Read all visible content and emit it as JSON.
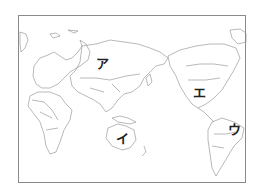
{
  "map": {
    "title": "",
    "projection": "Pacific-centered world map",
    "colors": {
      "outline": "#8a8a8a",
      "background": "#ffffff",
      "label": "#222222"
    },
    "labels": [
      {
        "id": "a",
        "text": "ア",
        "region": "Russia / northern Eurasia",
        "x": 102,
        "y": 63
      },
      {
        "id": "i",
        "text": "イ",
        "region": "Australia",
        "x": 122,
        "y": 138
      },
      {
        "id": "u",
        "text": "ウ",
        "region": "Brazil / South America",
        "x": 234,
        "y": 129
      },
      {
        "id": "e",
        "text": "エ",
        "region": "United States / North America",
        "x": 199,
        "y": 92
      }
    ]
  }
}
